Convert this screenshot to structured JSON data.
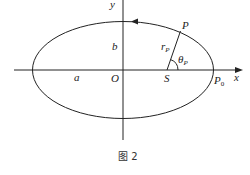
{
  "diagram": {
    "type": "ellipse-orbit",
    "caption": "图 2",
    "labels": {
      "y_axis": "y",
      "x_axis": "x",
      "origin": "O",
      "semi_major": "a",
      "semi_minor": "b",
      "focus": "S",
      "point": "P",
      "perihelion": "P",
      "perihelion_sub": "0",
      "radius": "r",
      "radius_sub": "P",
      "angle": "θ",
      "angle_sub": "P"
    },
    "colors": {
      "stroke": "#222222",
      "background": "#ffffff"
    }
  }
}
